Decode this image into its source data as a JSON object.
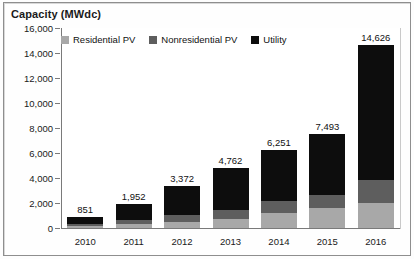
{
  "chart_data": {
    "type": "bar",
    "title": "Capacity (MWdc)",
    "xlabel": "",
    "ylabel": "",
    "stacked": true,
    "grid": false,
    "legend_position": "top-left",
    "ylim": [
      0,
      16000
    ],
    "ytick_values": [
      0,
      2000,
      4000,
      6000,
      8000,
      10000,
      12000,
      14000,
      16000
    ],
    "ytick_labels": [
      "0",
      "2,000",
      "4,000",
      "6,000",
      "8,000",
      "10,000",
      "12,000",
      "14,000",
      "16,000"
    ],
    "categories": [
      "2010",
      "2011",
      "2012",
      "2013",
      "2014",
      "2015",
      "2016"
    ],
    "series": [
      {
        "name": "Residential PV",
        "color": "#a8a8a8",
        "values": [
          180,
          300,
          490,
          700,
          1200,
          1600,
          2000
        ]
      },
      {
        "name": "Nonresidential PV",
        "color": "#5e5e5e",
        "values": [
          160,
          320,
          580,
          750,
          950,
          1050,
          1840
        ]
      },
      {
        "name": "Utility",
        "color": "#0d0d0d",
        "values": [
          511,
          1332,
          2302,
          3312,
          4101,
          4843,
          10786
        ]
      }
    ],
    "totals": [
      851,
      1952,
      3372,
      4762,
      6251,
      7493,
      14626
    ],
    "total_labels": [
      "851",
      "1,952",
      "3,372",
      "4,762",
      "6,251",
      "7,493",
      "14,626"
    ]
  }
}
